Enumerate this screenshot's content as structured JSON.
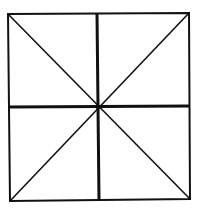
{
  "diagram": {
    "type": "square-with-midlines-and-diagonals",
    "stroke_color": "#111111",
    "background": "#ffffff",
    "square": {
      "corners": {
        "top_left": [
          8,
          14
        ],
        "top_right": [
          189,
          13
        ],
        "bottom_right": [
          190,
          199
        ],
        "bottom_left": [
          10,
          201
        ]
      },
      "border_width": 2
    },
    "center": [
      98,
      107
    ],
    "midlines": {
      "vertical": {
        "from": [
          97,
          13
        ],
        "to": [
          99,
          200
        ],
        "width": 3
      },
      "horizontal": {
        "from": [
          9,
          107
        ],
        "to": [
          190,
          106
        ],
        "width": 3
      }
    },
    "diagonals": [
      {
        "from": [
          8,
          14
        ],
        "to": [
          190,
          199
        ],
        "width": 1.6
      },
      {
        "from": [
          189,
          13
        ],
        "to": [
          10,
          201
        ],
        "width": 1.6
      }
    ]
  }
}
